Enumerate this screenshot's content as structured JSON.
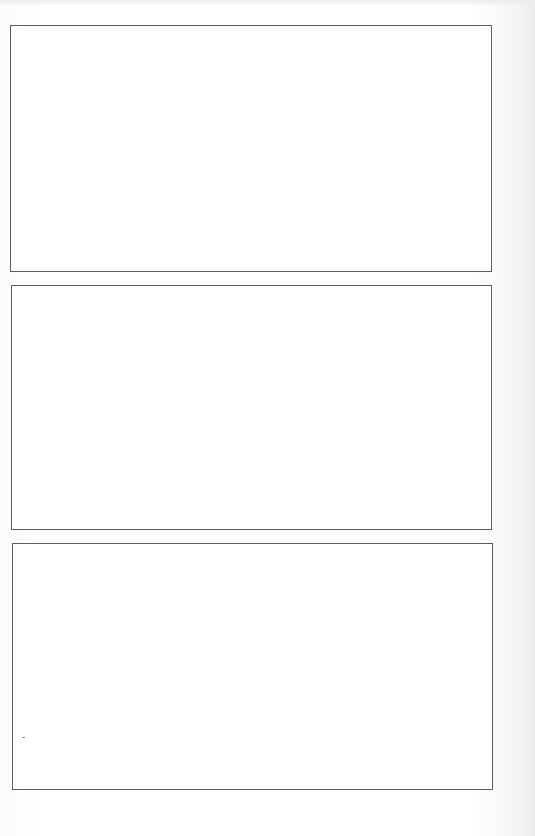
{
  "page": {
    "type": "blank-frames-sheet",
    "background_color": "#ffffff",
    "border_color": "#5e5e5e"
  },
  "frames": [
    {
      "label": "Frame 1",
      "x": 10,
      "y": 25,
      "width": 482,
      "height": 247,
      "content": ""
    },
    {
      "label": "Frame 2",
      "x": 11,
      "y": 285,
      "width": 481,
      "height": 245,
      "content": ""
    },
    {
      "label": "Frame 3",
      "x": 12,
      "y": 543,
      "width": 481,
      "height": 247,
      "content": ""
    }
  ]
}
